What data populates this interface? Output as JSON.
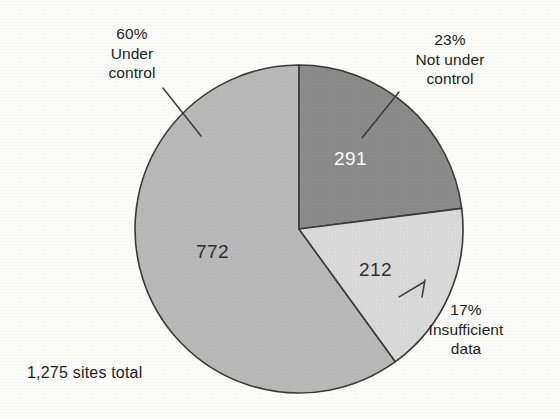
{
  "chart_data": {
    "type": "pie",
    "title": "",
    "subtitle": "",
    "caption": "1,275 sites total",
    "total": 1275,
    "total_label": "1,275",
    "units": "sites",
    "legend_position": "callouts",
    "grid": false,
    "categories": [
      "Under control",
      "Not under control",
      "Insufficient data"
    ],
    "values": [
      772,
      291,
      212
    ],
    "percents": [
      60,
      23,
      17
    ],
    "colors": [
      "#b9b9b9",
      "#8b8b8b",
      "#dadada"
    ],
    "slices": [
      {
        "label": "Under control",
        "percent_text": "60%",
        "percent": 60,
        "value": 772,
        "value_text": "772",
        "color": "#b9b9b9",
        "value_text_color": "#2f2f2f",
        "callout_text": "60%\nUnder\ncontrol",
        "start_angle": 144,
        "end_angle": 360
      },
      {
        "label": "Not under control",
        "percent_text": "23%",
        "percent": 23,
        "value": 291,
        "value_text": "291",
        "color": "#8b8b8b",
        "value_text_color": "#ffffff",
        "callout_text": "23%\nNot under\ncontrol",
        "start_angle": 0,
        "end_angle": 83
      },
      {
        "label": "Insufficient data",
        "percent_text": "17%",
        "percent": 17,
        "value": 212,
        "value_text": "212",
        "color": "#dadada",
        "value_text_color": "#2f2f2f",
        "callout_text": "17%\nInsufficient\ndata",
        "start_angle": 83,
        "end_angle": 144
      }
    ]
  },
  "callouts": {
    "under_control": "60%\nUnder\ncontrol",
    "not_under_control": "23%\nNot under\ncontrol",
    "insufficient_data": "17%\nInsufficient\ndata"
  },
  "slice_values": {
    "under_control": "772",
    "not_under_control": "291",
    "insufficient_data": "212"
  },
  "caption": {
    "total": "1,275 sites total"
  }
}
